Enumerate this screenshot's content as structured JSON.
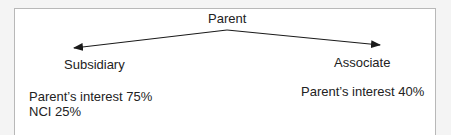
{
  "diagram": {
    "root": {
      "label": "Parent"
    },
    "children": [
      {
        "label": "Subsidiary",
        "details": [
          "Parent’s interest 75%",
          "NCI 25%"
        ]
      },
      {
        "label": "Associate",
        "details": [
          "Parent’s interest 40%"
        ]
      }
    ],
    "colors": {
      "line": "#1a1a1a",
      "frame": "#b8b8b8",
      "background": "#ffffff",
      "page": "#f4f4f4"
    }
  }
}
